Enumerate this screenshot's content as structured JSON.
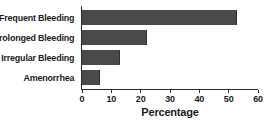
{
  "chart_data": {
    "type": "bar",
    "orientation": "horizontal",
    "title": "",
    "xlabel": "Percentage",
    "ylabel": "",
    "categories": [
      "Frequent Bleeding",
      "Prolonged Bleeding",
      "Irregular Bleeding",
      "Amenorrhea"
    ],
    "values": [
      53,
      22,
      13,
      6
    ],
    "xlim": [
      0,
      60
    ],
    "xticks": [
      0,
      10,
      20,
      30,
      40,
      50,
      60
    ],
    "xtick_labels": [
      "0",
      "10",
      "20",
      "30",
      "40",
      "50",
      "60"
    ],
    "grid": false,
    "legend": null,
    "bar_color": "#4a4a4a",
    "axis_color": "#2b2b2b",
    "background": "#ffffff"
  }
}
